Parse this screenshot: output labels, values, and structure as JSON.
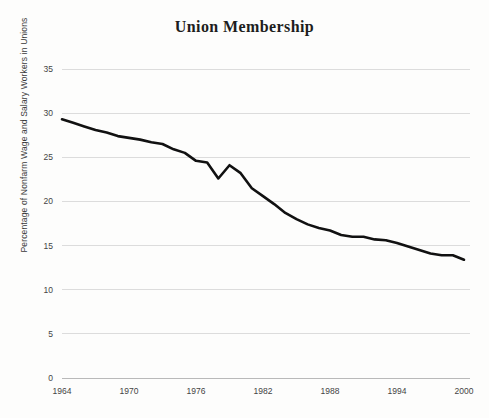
{
  "chart_data": {
    "type": "line",
    "title": "Union Membership",
    "xlabel": "",
    "ylabel": "Percentage of Nonfarm Wage and Salary Workers in Unions",
    "xlim": [
      1964,
      2000
    ],
    "ylim": [
      0,
      35
    ],
    "grid": true,
    "legend": "none",
    "y_ticks": [
      0,
      5,
      10,
      15,
      20,
      25,
      30,
      35
    ],
    "y_tick_labels": [
      "0",
      "5",
      "10",
      "15",
      "20",
      "25",
      "30",
      "35"
    ],
    "x_ticks": [
      1964,
      1970,
      1976,
      1982,
      1988,
      1994,
      2000
    ],
    "x_tick_labels": [
      "1964",
      "1970",
      "1976",
      "1982",
      "1988",
      "1994",
      "2000"
    ],
    "series": [
      {
        "name": "Union Membership",
        "color": "#111111",
        "x": [
          1964,
          1965,
          1966,
          1967,
          1968,
          1969,
          1970,
          1971,
          1972,
          1973,
          1974,
          1975,
          1976,
          1977,
          1978,
          1979,
          1980,
          1981,
          1982,
          1983,
          1984,
          1985,
          1986,
          1987,
          1988,
          1989,
          1990,
          1991,
          1992,
          1993,
          1994,
          1995,
          1996,
          1997,
          1998,
          1999,
          2000
        ],
        "values": [
          29.3,
          28.9,
          28.5,
          28.1,
          27.8,
          27.4,
          27.2,
          27.0,
          26.7,
          26.5,
          25.9,
          25.5,
          24.6,
          24.4,
          22.6,
          24.1,
          23.2,
          21.5,
          20.6,
          19.7,
          18.7,
          18.0,
          17.4,
          17.0,
          16.7,
          16.2,
          16.0,
          16.0,
          15.7,
          15.6,
          15.3,
          14.9,
          14.5,
          14.1,
          13.9,
          13.9,
          13.4
        ]
      }
    ]
  },
  "axis_titles": {
    "title": "Union Membership",
    "y_axis": "Percentage of Nonfarm Wage and Salary Workers in Unions"
  }
}
